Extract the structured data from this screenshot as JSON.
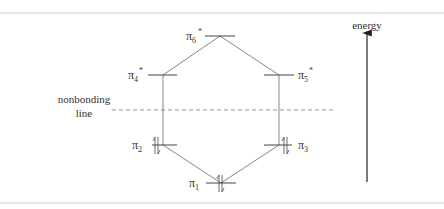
{
  "diagram": {
    "type": "molecular-orbital-energy-diagram",
    "colors": {
      "line": "#555555",
      "text": "#333333",
      "dashed": "#777777",
      "arrow": "#222222",
      "frame": "#e4e4e4"
    },
    "energy_axis": {
      "label": "energy"
    },
    "nonbonding": {
      "label_line1": "nonbonding",
      "label_line2": "line"
    },
    "orbitals": [
      {
        "id": "pi1",
        "symbol": "π",
        "subscript": "1",
        "star": "",
        "occupancy": "↑↓"
      },
      {
        "id": "pi2",
        "symbol": "π",
        "subscript": "2",
        "star": "",
        "occupancy": "↑↓"
      },
      {
        "id": "pi3",
        "symbol": "π",
        "subscript": "3",
        "star": "",
        "occupancy": "↑↓"
      },
      {
        "id": "pi4",
        "symbol": "π",
        "subscript": "4",
        "star": "*",
        "occupancy": ""
      },
      {
        "id": "pi5",
        "symbol": "π",
        "subscript": "5",
        "star": "*",
        "occupancy": ""
      },
      {
        "id": "pi6",
        "symbol": "π",
        "subscript": "6",
        "star": "*",
        "occupancy": ""
      }
    ]
  }
}
